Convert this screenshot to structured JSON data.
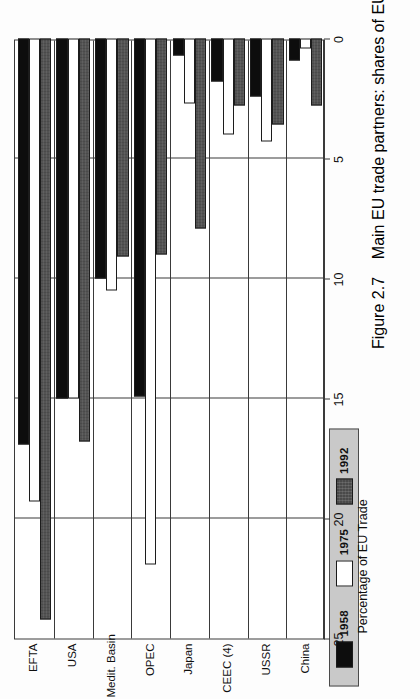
{
  "figure": {
    "caption_number": "Figure 2.7",
    "caption_text": "Main EU trade partners: shares of EU trade (exports plus imports)",
    "axis_title": "Percentage of EU Trade"
  },
  "legend": {
    "title": "",
    "items": [
      {
        "label": "1958",
        "swatch": "black-swatch",
        "color": "#0d0d0d"
      },
      {
        "label": "1975",
        "swatch": "white-swatch",
        "color": "#ffffff"
      },
      {
        "label": "1992",
        "swatch": "hatched-dark-swatch",
        "color": "#4a4a4a"
      }
    ],
    "background": "#c9c9c9"
  },
  "axis": {
    "ticks": [
      "0",
      "5",
      "10",
      "15",
      "20",
      "25"
    ],
    "min": 0,
    "max": 25,
    "step": 5
  },
  "chart_data": {
    "type": "bar",
    "orientation": "horizontal",
    "title": "Main EU trade partners: shares of EU trade (exports plus imports)",
    "xlabel": "Percentage of EU Trade",
    "ylabel": "",
    "xlim": [
      0,
      25
    ],
    "grid": true,
    "legend_position": "top-left",
    "categories": [
      "EFTA",
      "USA",
      "Medit. Basin",
      "OPEC",
      "Japan",
      "CEEC (4)",
      "USSR",
      "China"
    ],
    "series": [
      {
        "name": "1958",
        "color": "#0d0d0d",
        "values": [
          16.9,
          15.0,
          10.0,
          14.9,
          0.7,
          1.8,
          2.4,
          0.9
        ]
      },
      {
        "name": "1975",
        "color": "#ffffff",
        "values": [
          19.3,
          15.0,
          10.5,
          21.9,
          2.7,
          4.0,
          4.3,
          0.4
        ]
      },
      {
        "name": "1992",
        "color": "#4a4a4a",
        "values": [
          24.2,
          16.8,
          9.1,
          9.0,
          7.9,
          2.8,
          3.6,
          2.8
        ]
      }
    ]
  }
}
